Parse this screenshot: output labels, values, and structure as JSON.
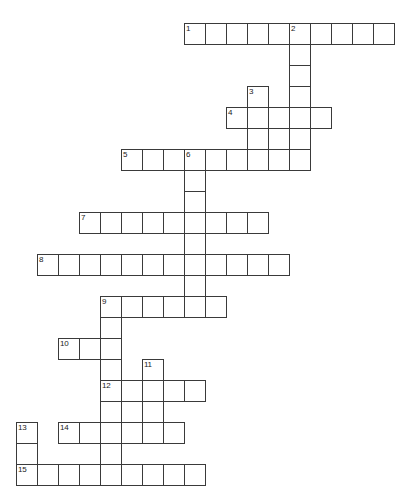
{
  "puzzle": {
    "title": "Crossword Puzzle Grid",
    "grid": {
      "cell_size": 21,
      "origin_x": 16,
      "origin_y": 23,
      "columns": 19,
      "rows": 22,
      "line_color": "#3a3a3a",
      "cell_fill": "#ffffff",
      "background": "#ffffff"
    },
    "numbers": [
      1,
      2,
      3,
      4,
      5,
      6,
      7,
      8,
      9,
      10,
      11,
      12,
      13,
      14,
      15
    ],
    "entries": [
      {
        "number": 1,
        "direction": "across",
        "col": 8,
        "row": 0,
        "length": 10
      },
      {
        "number": 2,
        "direction": "down",
        "col": 13,
        "row": 0,
        "length": 6
      },
      {
        "number": 3,
        "direction": "down",
        "col": 11,
        "row": 3,
        "length": 6
      },
      {
        "number": 4,
        "direction": "across",
        "col": 10,
        "row": 4,
        "length": 5
      },
      {
        "number": 5,
        "across_col": 5,
        "direction": "across",
        "col": 5,
        "row": 6,
        "length": 9
      },
      {
        "number": 6,
        "direction": "down",
        "col": 8,
        "row": 6,
        "length": 6
      },
      {
        "number": 7,
        "direction": "across",
        "col": 3,
        "row": 9,
        "length": 9
      },
      {
        "number": 8,
        "direction": "across",
        "col": 1,
        "row": 11,
        "length": 12
      },
      {
        "number": 9,
        "direction": "across",
        "col": 4,
        "row": 13,
        "length": 6
      },
      {
        "number": 9,
        "direction": "down",
        "col": 4,
        "row": 13,
        "length": 9
      },
      {
        "number": 10,
        "direction": "across",
        "col": 2,
        "row": 15,
        "length": 3
      },
      {
        "number": 11,
        "direction": "down",
        "col": 6,
        "row": 16,
        "length": 5
      },
      {
        "number": 12,
        "direction": "across",
        "col": 4,
        "row": 17,
        "length": 5
      },
      {
        "number": 13,
        "direction": "down",
        "col": 0,
        "row": 19,
        "length": 3
      },
      {
        "number": 14,
        "direction": "across",
        "col": 2,
        "row": 19,
        "length": 6
      },
      {
        "number": 15,
        "direction": "across",
        "col": 0,
        "row": 21,
        "length": 9
      }
    ],
    "cells": [
      {
        "col": 8,
        "row": 0,
        "num": "1"
      },
      {
        "col": 9,
        "row": 0,
        "num": ""
      },
      {
        "col": 10,
        "row": 0,
        "num": ""
      },
      {
        "col": 11,
        "row": 0,
        "num": ""
      },
      {
        "col": 12,
        "row": 0,
        "num": ""
      },
      {
        "col": 13,
        "row": 0,
        "num": "2"
      },
      {
        "col": 14,
        "row": 0,
        "num": ""
      },
      {
        "col": 15,
        "row": 0,
        "num": ""
      },
      {
        "col": 16,
        "row": 0,
        "num": ""
      },
      {
        "col": 17,
        "row": 0,
        "num": ""
      },
      {
        "col": 13,
        "row": 1,
        "num": ""
      },
      {
        "col": 13,
        "row": 2,
        "num": ""
      },
      {
        "col": 11,
        "row": 3,
        "num": "3"
      },
      {
        "col": 13,
        "row": 3,
        "num": ""
      },
      {
        "col": 10,
        "row": 4,
        "num": "4"
      },
      {
        "col": 11,
        "row": 4,
        "num": ""
      },
      {
        "col": 12,
        "row": 4,
        "num": ""
      },
      {
        "col": 13,
        "row": 4,
        "num": ""
      },
      {
        "col": 14,
        "row": 4,
        "num": ""
      },
      {
        "col": 11,
        "row": 5,
        "num": ""
      },
      {
        "col": 13,
        "row": 5,
        "num": ""
      },
      {
        "col": 5,
        "row": 6,
        "num": "5"
      },
      {
        "col": 6,
        "row": 6,
        "num": ""
      },
      {
        "col": 7,
        "row": 6,
        "num": ""
      },
      {
        "col": 8,
        "row": 6,
        "num": "6"
      },
      {
        "col": 9,
        "row": 6,
        "num": ""
      },
      {
        "col": 10,
        "row": 6,
        "num": ""
      },
      {
        "col": 11,
        "row": 6,
        "num": ""
      },
      {
        "col": 12,
        "row": 6,
        "num": ""
      },
      {
        "col": 13,
        "row": 6,
        "num": ""
      },
      {
        "col": 8,
        "row": 7,
        "num": ""
      },
      {
        "col": 8,
        "row": 8,
        "num": ""
      },
      {
        "col": 3,
        "row": 9,
        "num": "7"
      },
      {
        "col": 4,
        "row": 9,
        "num": ""
      },
      {
        "col": 5,
        "row": 9,
        "num": ""
      },
      {
        "col": 6,
        "row": 9,
        "num": ""
      },
      {
        "col": 7,
        "row": 9,
        "num": ""
      },
      {
        "col": 8,
        "row": 9,
        "num": ""
      },
      {
        "col": 9,
        "row": 9,
        "num": ""
      },
      {
        "col": 10,
        "row": 9,
        "num": ""
      },
      {
        "col": 11,
        "row": 9,
        "num": ""
      },
      {
        "col": 8,
        "row": 10,
        "num": ""
      },
      {
        "col": 1,
        "row": 11,
        "num": "8"
      },
      {
        "col": 2,
        "row": 11,
        "num": ""
      },
      {
        "col": 3,
        "row": 11,
        "num": ""
      },
      {
        "col": 4,
        "row": 11,
        "num": ""
      },
      {
        "col": 5,
        "row": 11,
        "num": ""
      },
      {
        "col": 6,
        "row": 11,
        "num": ""
      },
      {
        "col": 7,
        "row": 11,
        "num": ""
      },
      {
        "col": 8,
        "row": 11,
        "num": ""
      },
      {
        "col": 9,
        "row": 11,
        "num": ""
      },
      {
        "col": 10,
        "row": 11,
        "num": ""
      },
      {
        "col": 11,
        "row": 11,
        "num": ""
      },
      {
        "col": 12,
        "row": 11,
        "num": ""
      },
      {
        "col": 8,
        "row": 12,
        "num": ""
      },
      {
        "col": 4,
        "row": 13,
        "num": "9"
      },
      {
        "col": 5,
        "row": 13,
        "num": ""
      },
      {
        "col": 6,
        "row": 13,
        "num": ""
      },
      {
        "col": 7,
        "row": 13,
        "num": ""
      },
      {
        "col": 8,
        "row": 13,
        "num": ""
      },
      {
        "col": 9,
        "row": 13,
        "num": ""
      },
      {
        "col": 4,
        "row": 14,
        "num": ""
      },
      {
        "col": 2,
        "row": 15,
        "num": "10"
      },
      {
        "col": 3,
        "row": 15,
        "num": ""
      },
      {
        "col": 4,
        "row": 15,
        "num": ""
      },
      {
        "col": 4,
        "row": 16,
        "num": ""
      },
      {
        "col": 6,
        "row": 16,
        "num": "11"
      },
      {
        "col": 4,
        "row": 17,
        "num": "12"
      },
      {
        "col": 5,
        "row": 17,
        "num": ""
      },
      {
        "col": 6,
        "row": 17,
        "num": ""
      },
      {
        "col": 7,
        "row": 17,
        "num": ""
      },
      {
        "col": 8,
        "row": 17,
        "num": ""
      },
      {
        "col": 4,
        "row": 18,
        "num": ""
      },
      {
        "col": 6,
        "row": 18,
        "num": ""
      },
      {
        "col": 0,
        "row": 19,
        "num": "13"
      },
      {
        "col": 2,
        "row": 19,
        "num": "14"
      },
      {
        "col": 3,
        "row": 19,
        "num": ""
      },
      {
        "col": 4,
        "row": 19,
        "num": ""
      },
      {
        "col": 5,
        "row": 19,
        "num": ""
      },
      {
        "col": 6,
        "row": 19,
        "num": ""
      },
      {
        "col": 7,
        "row": 19,
        "num": ""
      },
      {
        "col": 0,
        "row": 20,
        "num": ""
      },
      {
        "col": 4,
        "row": 20,
        "num": ""
      },
      {
        "col": 0,
        "row": 21,
        "num": "15"
      },
      {
        "col": 1,
        "row": 21,
        "num": ""
      },
      {
        "col": 2,
        "row": 21,
        "num": ""
      },
      {
        "col": 3,
        "row": 21,
        "num": ""
      },
      {
        "col": 4,
        "row": 21,
        "num": ""
      },
      {
        "col": 5,
        "row": 21,
        "num": ""
      },
      {
        "col": 6,
        "row": 21,
        "num": ""
      },
      {
        "col": 7,
        "row": 21,
        "num": ""
      },
      {
        "col": 8,
        "row": 21,
        "num": ""
      }
    ]
  }
}
